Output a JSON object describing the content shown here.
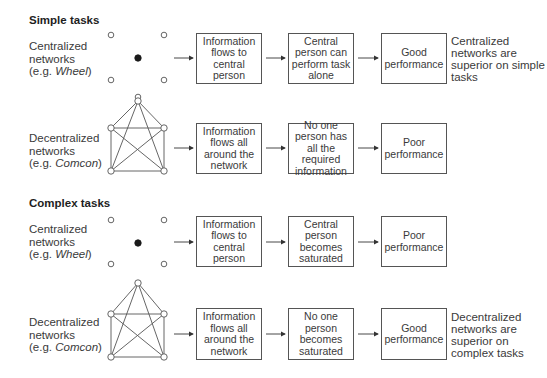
{
  "sections": [
    {
      "title": "Simple tasks",
      "rows": [
        {
          "network": {
            "line1": "Centralized",
            "line2": "networks",
            "prefix": "(e.g. ",
            "name": "Wheel",
            "suffix": ")",
            "type": "wheel"
          },
          "steps": [
            "Information flows to central person",
            "Central person can perform task alone",
            "Good performance"
          ],
          "conclusion": "Centralized networks are superior on simple tasks"
        },
        {
          "network": {
            "line1": "Decentralized",
            "line2": "networks",
            "prefix": "(e.g. ",
            "name": "Comcon",
            "suffix": ")",
            "type": "comcon"
          },
          "steps": [
            "Information flows all around the network",
            "No one person has all the required information",
            "Poor performance"
          ],
          "conclusion": ""
        }
      ]
    },
    {
      "title": "Complex tasks",
      "rows": [
        {
          "network": {
            "line1": "Centralized",
            "line2": "networks",
            "prefix": "(e.g. ",
            "name": "Wheel",
            "suffix": ")",
            "type": "wheel"
          },
          "steps": [
            "Information flows to central person",
            "Central person becomes saturated",
            "Poor performance"
          ],
          "conclusion": ""
        },
        {
          "network": {
            "line1": "Decentralized",
            "line2": "networks",
            "prefix": "(e.g. ",
            "name": "Comcon",
            "suffix": ")",
            "type": "comcon"
          },
          "steps": [
            "Information flows all around the network",
            "No one person becomes saturated",
            "Good performance"
          ],
          "conclusion": "Decentralized networks are superior on complex tasks"
        }
      ]
    }
  ],
  "colors": {
    "line": "#555555",
    "node_fill_center": "#1a1a1a",
    "text": "#3a3a3a"
  }
}
